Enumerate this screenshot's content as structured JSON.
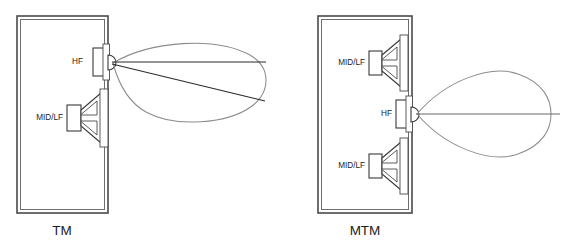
{
  "figure": {
    "background_color": "#ffffff",
    "line_color": "#3a3a3a",
    "lobe_color": "#8c8c8c",
    "axis_color": "#2b2b2b",
    "text_color": "#1c1c1c"
  },
  "panels": [
    {
      "id": "tm",
      "caption": "TM",
      "caption_x": 62,
      "caption_y": 231,
      "cabinet": {
        "x": 17,
        "y": 16,
        "width": 91,
        "height": 197
      },
      "drivers": [
        {
          "type": "tweeter",
          "label": "HF",
          "label_x": 83,
          "label_y": 62,
          "center_y": 62
        },
        {
          "type": "woofer",
          "label": "MID/LF",
          "label_x": 45,
          "label_y": 118,
          "center_y": 118
        }
      ],
      "lobe": {
        "tilt": "downward",
        "origin_x": 112,
        "origin_y": 62,
        "tip_x": 266,
        "axis_lines": [
          {
            "x1": 112,
            "y1": 62,
            "x2": 266,
            "y2": 62
          },
          {
            "x1": 112,
            "y1": 64,
            "x2": 265,
            "y2": 101
          }
        ]
      }
    },
    {
      "id": "mtm",
      "caption": "MTM",
      "caption_x": 365,
      "caption_y": 231,
      "cabinet": {
        "x": 318,
        "y": 16,
        "width": 94,
        "height": 197
      },
      "drivers": [
        {
          "type": "woofer",
          "label": "MID/LF",
          "label_x": 347,
          "label_y": 63,
          "center_y": 63
        },
        {
          "type": "tweeter",
          "label": "HF",
          "label_x": 392,
          "label_y": 114,
          "center_y": 114
        },
        {
          "type": "woofer",
          "label": "MID/LF",
          "label_x": 347,
          "label_y": 166,
          "center_y": 166
        }
      ],
      "lobe": {
        "tilt": "symmetric",
        "origin_x": 416,
        "origin_y": 114,
        "tip_x": 551,
        "axis_lines": [
          {
            "x1": 416,
            "y1": 114,
            "x2": 560,
            "y2": 114
          }
        ]
      }
    }
  ],
  "labels": {
    "hf": "HF",
    "midlf": "MID/LF",
    "tm": "TM",
    "mtm": "MTM"
  }
}
